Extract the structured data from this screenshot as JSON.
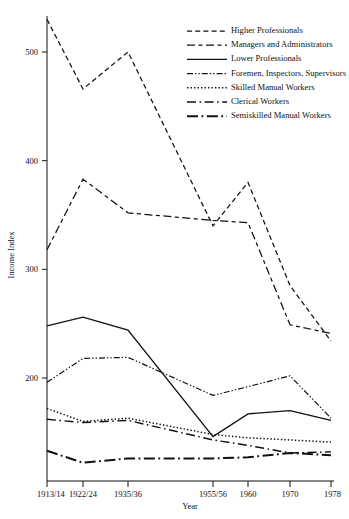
{
  "chart_data": {
    "type": "line",
    "title": "",
    "xlabel": "Year",
    "ylabel": "Income Index",
    "categories": [
      "1913/14",
      "1922/24",
      "1935/36",
      "1955/56",
      "1960",
      "1970",
      "1978"
    ],
    "x_tick_labels": [
      "1913/14",
      "1922/24",
      "1935/36",
      "1955/56",
      "1960",
      "1970",
      "1978"
    ],
    "y_tick_labels": [
      "200",
      "300",
      "400",
      "500"
    ],
    "y_ticks": [
      200,
      300,
      400,
      500
    ],
    "ylim": [
      120,
      545
    ],
    "xlim": [
      1913,
      1978
    ],
    "grid": false,
    "legend_position": "top-right",
    "series": [
      {
        "name": "Higher Professionals",
        "style": "dashed",
        "values": [
          530,
          466,
          500,
          340,
          380,
          285,
          234
        ]
      },
      {
        "name": "Managers and Administrators",
        "style": "long-dash-short-dash",
        "values": [
          318,
          383,
          352,
          345,
          343,
          249,
          241
        ]
      },
      {
        "name": "Lower Professionals",
        "style": "solid",
        "values": [
          248,
          256,
          244,
          146,
          167,
          170,
          161
        ]
      },
      {
        "name": "Foremen, Inspectors, Supervisors",
        "style": "dash-dot-dot",
        "values": [
          196,
          218,
          219,
          184,
          192,
          202,
          163
        ]
      },
      {
        "name": "Skilled Manual Workers",
        "style": "dotted",
        "values": [
          172,
          160,
          163,
          148,
          145,
          143,
          141
        ]
      },
      {
        "name": "Clerical Workers",
        "style": "long-dash-dot",
        "values": [
          162,
          159,
          161,
          143,
          138,
          131,
          132
        ]
      },
      {
        "name": "Semiskilled Manual Workers",
        "style": "thick-dash-dot",
        "values": [
          133,
          122,
          126,
          126,
          127,
          131,
          129
        ]
      }
    ]
  },
  "axes": {
    "y_title": "Income Index",
    "x_title": "Year"
  },
  "legend": {
    "items": [
      {
        "label": "Higher Professionals"
      },
      {
        "label": "Managers and Administrators"
      },
      {
        "label": "Lower Professionals"
      },
      {
        "label": "Foremen, Inspectors, Supervisors"
      },
      {
        "label": "Skilled Manual Workers"
      },
      {
        "label": "Clerical Workers"
      },
      {
        "label": "Semiskilled Manual Workers"
      }
    ]
  }
}
